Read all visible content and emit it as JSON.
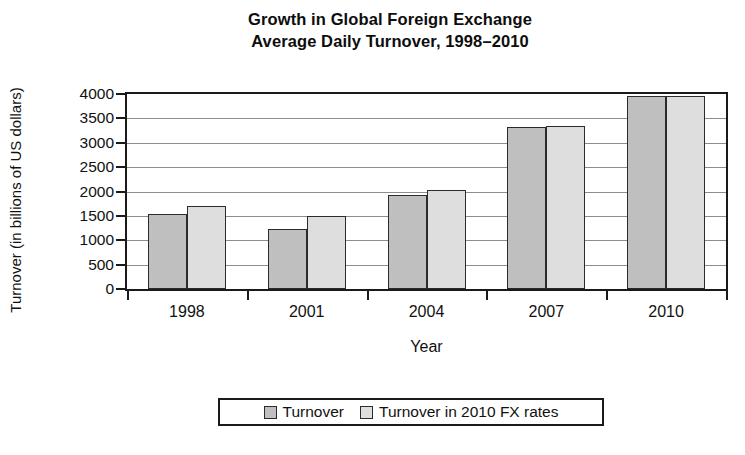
{
  "chart_data": {
    "type": "bar",
    "title": "Growth in Global Foreign Exchange Average Daily Turnover, 1998–2010",
    "title_lines": [
      "Growth in Global Foreign Exchange",
      "Average Daily Turnover, 1998–2010"
    ],
    "xlabel": "Year",
    "ylabel": "Turnover (in billions of US dollars)",
    "categories": [
      "1998",
      "2001",
      "2004",
      "2007",
      "2010"
    ],
    "series": [
      {
        "name": "Turnover",
        "color": "#bfbfbf",
        "values": [
          1530,
          1240,
          1930,
          3320,
          3950
        ]
      },
      {
        "name": "Turnover in 2010 FX rates",
        "color": "#dedede",
        "values": [
          1700,
          1500,
          2030,
          3350,
          3960
        ]
      }
    ],
    "ylim": [
      0,
      4000
    ],
    "yticks": [
      0,
      500,
      1000,
      1500,
      2000,
      2500,
      3000,
      3500,
      4000
    ],
    "ytick_labels": [
      "0",
      "500",
      "1000",
      "1500",
      "2000",
      "2500",
      "3000",
      "3500",
      "4000"
    ],
    "grid": true,
    "grid_axis": "y",
    "legend_position": "bottom",
    "legend_entries": [
      "Turnover",
      "Turnover in 2010 FX rates"
    ],
    "bar_edge_color": "#2b2b2b",
    "axis_color": "#1a1a1a",
    "gridline_color": "#8d8d8d",
    "background": "#ffffff"
  }
}
